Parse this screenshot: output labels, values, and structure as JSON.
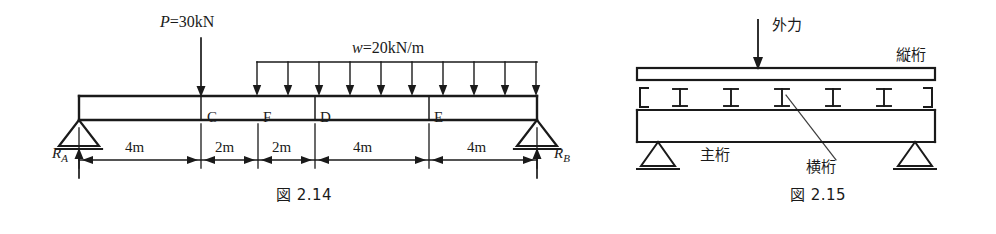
{
  "page": {
    "width": 996,
    "height": 234,
    "background": "#ffffff",
    "ink": "#1a1a1a"
  },
  "figure_214": {
    "caption": "図 2.14",
    "point_load": {
      "label_full": "P = 30kN",
      "symbol": "P",
      "equals": "=",
      "value": "30kN",
      "position_m": 4
    },
    "distributed_load": {
      "label_full": "w = 20kN/m",
      "symbol": "w",
      "equals": "=",
      "value": "20kN/m",
      "start_m": 8,
      "end_m": 16,
      "arrow_count": 10
    },
    "reactions": {
      "left": {
        "symbol": "R",
        "subscript": "A",
        "support": "pin-support"
      },
      "right": {
        "symbol": "R",
        "subscript": "B",
        "support": "roller-support"
      }
    },
    "point_labels": [
      "C",
      "F",
      "D",
      "E"
    ],
    "dimensions": [
      "4m",
      "2m",
      "2m",
      "4m",
      "4m"
    ],
    "span_total_m": 16
  },
  "figure_215": {
    "caption": "図 2.15",
    "external_force_label": "外力",
    "stringer_label": "縦桁",
    "main_girder_label": "主桁",
    "cross_beam_label": "横桁",
    "cross_beam_glyph": "I",
    "cross_beam_count": 5,
    "bracket_left": "[",
    "bracket_right": "]",
    "supports": [
      "pin-support",
      "roller-support"
    ]
  }
}
